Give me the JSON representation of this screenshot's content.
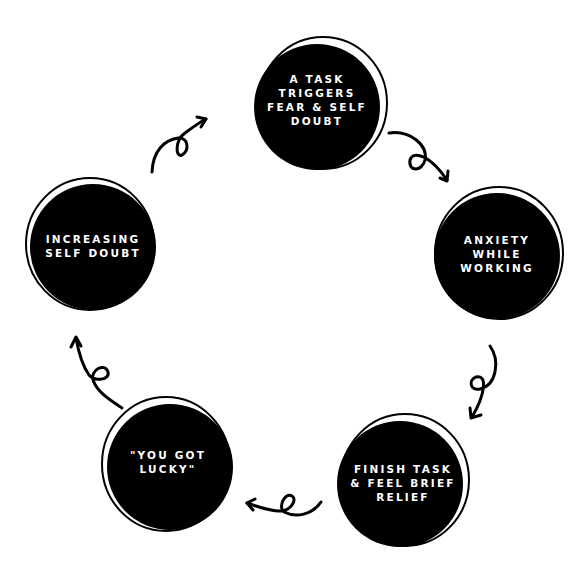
{
  "diagram": {
    "type": "cycle",
    "colors": {
      "circle_fill": "#000000",
      "outline": "#000000",
      "text": "#ffffff",
      "background": "#ffffff"
    },
    "nodes": [
      {
        "id": "task-triggers",
        "lines": [
          "A TASK",
          "TRIGGERS",
          "FEAR & SELF",
          "DOUBT"
        ]
      },
      {
        "id": "anxiety",
        "lines": [
          "ANXIETY",
          "WHILE",
          "WORKING"
        ]
      },
      {
        "id": "finish-task",
        "lines": [
          "FINISH TASK",
          "& FEEL BRIEF",
          "RELIEF"
        ]
      },
      {
        "id": "you-got-lucky",
        "lines": [
          "\"YOU GOT",
          "LUCKY\""
        ]
      },
      {
        "id": "increasing-doubt",
        "lines": [
          "INCREASING",
          "SELF DOUBT"
        ]
      }
    ],
    "arrows": [
      {
        "from": "task-triggers",
        "to": "anxiety",
        "icon": "loop-arrow-icon"
      },
      {
        "from": "anxiety",
        "to": "finish-task",
        "icon": "loop-arrow-icon"
      },
      {
        "from": "finish-task",
        "to": "you-got-lucky",
        "icon": "loop-arrow-icon"
      },
      {
        "from": "you-got-lucky",
        "to": "increasing-doubt",
        "icon": "loop-arrow-icon"
      },
      {
        "from": "increasing-doubt",
        "to": "task-triggers",
        "icon": "loop-arrow-icon"
      }
    ]
  }
}
